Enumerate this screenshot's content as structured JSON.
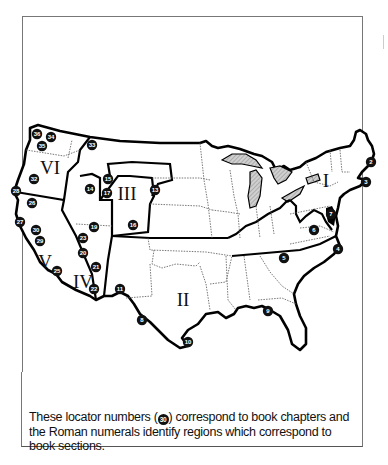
{
  "map": {
    "title": "United States locator map",
    "regions": [
      {
        "numeral": "I",
        "x": 326,
        "y": 181
      },
      {
        "numeral": "II",
        "x": 183,
        "y": 300
      },
      {
        "numeral": "III",
        "x": 125,
        "y": 195
      },
      {
        "numeral": "IV",
        "x": 82,
        "y": 283
      },
      {
        "numeral": "V",
        "x": 43,
        "y": 264
      },
      {
        "numeral": "VI",
        "x": 48,
        "y": 168
      }
    ],
    "locators": [
      {
        "n": "2",
        "x": 371,
        "y": 162
      },
      {
        "n": "3",
        "x": 366,
        "y": 182
      },
      {
        "n": "4",
        "x": 338,
        "y": 249
      },
      {
        "n": "5",
        "x": 284,
        "y": 258
      },
      {
        "n": "6",
        "x": 314,
        "y": 230
      },
      {
        "n": "7",
        "x": 331,
        "y": 214
      },
      {
        "n": "8",
        "x": 142,
        "y": 320
      },
      {
        "n": "9",
        "x": 268,
        "y": 311
      },
      {
        "n": "10",
        "x": 188,
        "y": 342
      },
      {
        "n": "11",
        "x": 120,
        "y": 289
      },
      {
        "n": "13",
        "x": 155,
        "y": 190
      },
      {
        "n": "14",
        "x": 90,
        "y": 189
      },
      {
        "n": "15",
        "x": 108,
        "y": 179
      },
      {
        "n": "16",
        "x": 133,
        "y": 225
      },
      {
        "n": "17",
        "x": 107,
        "y": 193
      },
      {
        "n": "19",
        "x": 94,
        "y": 227
      },
      {
        "n": "20",
        "x": 83,
        "y": 253
      },
      {
        "n": "21",
        "x": 96,
        "y": 267
      },
      {
        "n": "22",
        "x": 94,
        "y": 289
      },
      {
        "n": "23",
        "x": 83,
        "y": 238
      },
      {
        "n": "25",
        "x": 57,
        "y": 271
      },
      {
        "n": "26",
        "x": 32,
        "y": 203
      },
      {
        "n": "27",
        "x": 20,
        "y": 222
      },
      {
        "n": "28",
        "x": 16,
        "y": 191
      },
      {
        "n": "29",
        "x": 40,
        "y": 241
      },
      {
        "n": "30",
        "x": 36,
        "y": 230
      },
      {
        "n": "32",
        "x": 34,
        "y": 179
      },
      {
        "n": "33",
        "x": 92,
        "y": 145
      },
      {
        "n": "34",
        "x": 51,
        "y": 137
      },
      {
        "n": "35",
        "x": 42,
        "y": 146
      },
      {
        "n": "36",
        "x": 37,
        "y": 134
      }
    ]
  },
  "caption": {
    "before": "These locator numbers (",
    "sample_number": "30",
    "after": ")  correspond to book chapters and the Roman numerals identify regions which correspond to book sections."
  },
  "colors": {
    "outline": "#000000",
    "state_border": "#555555",
    "lakes": "#bdbdbd",
    "frame": "#777777"
  }
}
